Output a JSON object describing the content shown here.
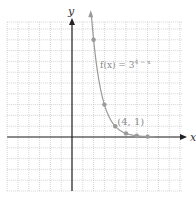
{
  "chart_data": {
    "type": "line",
    "title": "",
    "xlabel": "x",
    "ylabel": "y",
    "xlim": [
      -6,
      10
    ],
    "ylim": [
      -5,
      10
    ],
    "grid": true,
    "series": [
      {
        "name": "f(x) = 3^(4 − x)",
        "function": "3^(4-x)",
        "x": [
          2,
          3,
          4,
          5,
          6,
          7
        ],
        "y": [
          9,
          3,
          1,
          0.333,
          0.111,
          0.037
        ]
      }
    ],
    "annotations": [
      {
        "text_parts": [
          "f(x) = 3",
          "4 − x"
        ],
        "anchor": "curve-label"
      },
      {
        "text": "(4, 1)",
        "point": [
          4,
          1
        ]
      }
    ],
    "colors": {
      "axis": "#222222",
      "curve": "#9a9a9a",
      "grid": "#b8b8b8"
    }
  },
  "labels": {
    "x_axis": "x",
    "y_axis": "y",
    "function_base": "f(x) = 3",
    "function_exp": "4 − x",
    "point_label": "(4, 1)"
  }
}
